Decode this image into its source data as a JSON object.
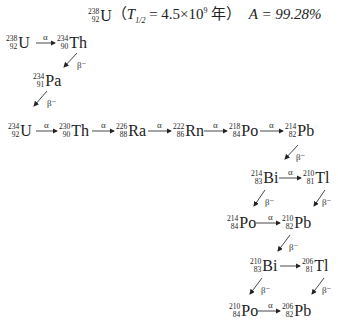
{
  "title": {
    "mass": "238",
    "atomic": "92",
    "symbol": "U",
    "half_life_label": "T",
    "half_life_sub": "1/2",
    "half_life_value": " = 4.5×10",
    "half_life_exp": "9",
    "unit": " 年）",
    "abundance": "A = 99.28%"
  },
  "nuclides": [
    {
      "id": "U238",
      "mass": "238",
      "z": "92",
      "sym": "U"
    },
    {
      "id": "Th234",
      "mass": "234",
      "z": "90",
      "sym": "Th"
    },
    {
      "id": "Pa234",
      "mass": "234",
      "z": "91",
      "sym": "Pa"
    },
    {
      "id": "U234",
      "mass": "234",
      "z": "92",
      "sym": "U"
    },
    {
      "id": "Th230",
      "mass": "230",
      "z": "90",
      "sym": "Th"
    },
    {
      "id": "Ra226",
      "mass": "226",
      "z": "88",
      "sym": "Ra"
    },
    {
      "id": "Rn222",
      "mass": "222",
      "z": "86",
      "sym": "Rn"
    },
    {
      "id": "Po218",
      "mass": "218",
      "z": "84",
      "sym": "Po"
    },
    {
      "id": "Pb214",
      "mass": "214",
      "z": "82",
      "sym": "Pb"
    },
    {
      "id": "Bi214",
      "mass": "214",
      "z": "83",
      "sym": "Bi"
    },
    {
      "id": "Tl210",
      "mass": "210",
      "z": "81",
      "sym": "Tl"
    },
    {
      "id": "Po214",
      "mass": "214",
      "z": "84",
      "sym": "Po"
    },
    {
      "id": "Pb210",
      "mass": "210",
      "z": "82",
      "sym": "Pb"
    },
    {
      "id": "Bi210",
      "mass": "210",
      "z": "83",
      "sym": "Bi"
    },
    {
      "id": "Tl206",
      "mass": "206",
      "z": "81",
      "sym": "Tl"
    },
    {
      "id": "Po210",
      "mass": "210",
      "z": "84",
      "sym": "Po"
    },
    {
      "id": "Pb206",
      "mass": "206",
      "z": "82",
      "sym": "Pb"
    }
  ],
  "labels": {
    "alpha": "α",
    "beta": "β⁻"
  }
}
